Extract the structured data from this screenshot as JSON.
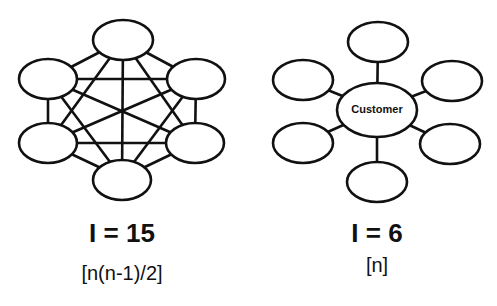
{
  "left_diagram": {
    "interface_count_label": "I = 15",
    "formula_label": "[n(n-1)/2]"
  },
  "right_diagram": {
    "center_node_label": "Customer",
    "interface_count_label": "I = 6",
    "formula_label": "[n]"
  }
}
